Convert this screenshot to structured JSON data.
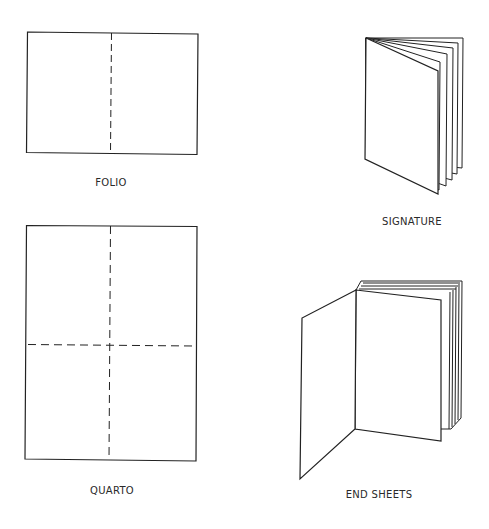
{
  "diagram": {
    "stroke_color": "#222222",
    "background": "#ffffff",
    "figures": [
      {
        "id": "folio",
        "label": "FOLIO",
        "type": "sheet-folded-once"
      },
      {
        "id": "signature",
        "label": "SIGNATURE",
        "type": "folded-pages-stack"
      },
      {
        "id": "quarto",
        "label": "QUARTO",
        "type": "sheet-folded-twice"
      },
      {
        "id": "end-sheets",
        "label": "END SHEETS",
        "type": "book-with-open-end-sheet"
      }
    ]
  }
}
